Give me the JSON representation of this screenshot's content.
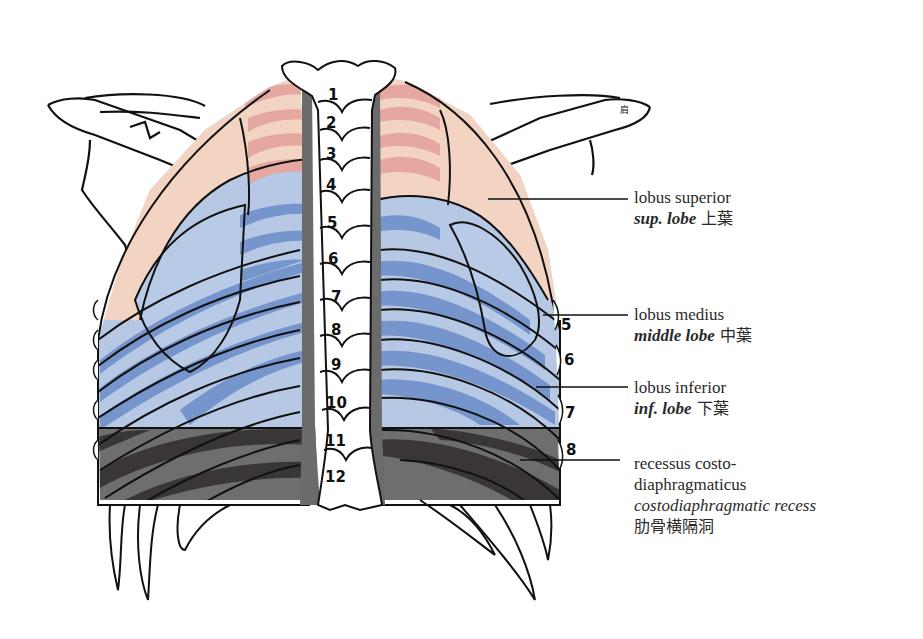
{
  "figure": {
    "colors": {
      "superior_lobe": "#f3d4c2",
      "superior_lobe_rib": "#e4a8a0",
      "middle_lobe": "#b9cbe6",
      "inferior_lobe_light": "#b6c8e4",
      "inferior_lobe_dark": "#6f8fc9",
      "recess_light": "#6e6e6e",
      "recess_dark": "#3a3636",
      "spine_shadow": "#6b6b6b",
      "outline": "#111111"
    },
    "vertebra_numbers": [
      "1",
      "2",
      "3",
      "4",
      "5",
      "6",
      "7",
      "8",
      "9",
      "10",
      "11",
      "12"
    ],
    "rib_numbers": [
      "5",
      "6",
      "7",
      "8"
    ],
    "corner_mark": "肩"
  },
  "labels": [
    {
      "id": "superior",
      "latin": "lobus superior",
      "english": "sup. lobe",
      "japanese": "上葉"
    },
    {
      "id": "middle",
      "latin": "lobus medius",
      "english": "middle lobe",
      "japanese": "中葉"
    },
    {
      "id": "inferior",
      "latin": "lobus inferior",
      "english": "inf. lobe",
      "japanese": "下葉"
    },
    {
      "id": "recess",
      "latin_line1": "recessus costo-",
      "latin_line2": "diaphragmaticus",
      "english": "costodiaphragmatic recess",
      "japanese": "肋骨横隔洞"
    }
  ]
}
